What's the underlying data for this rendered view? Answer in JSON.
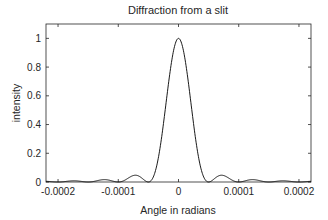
{
  "chart_data": {
    "type": "line",
    "title": "Diffraction from a slit",
    "xlabel": "Angle in radians",
    "ylabel": "intensity",
    "xlim": [
      -0.00022,
      0.00022
    ],
    "ylim": [
      0,
      1.1
    ],
    "xticks": [
      -0.0002,
      -0.0001,
      0,
      0.0001,
      0.0002
    ],
    "xtick_labels": [
      "-0.0002",
      "-0.0001",
      "0",
      "0.0001",
      "0.0002"
    ],
    "yticks": [
      0,
      0.2,
      0.4,
      0.6,
      0.8,
      1
    ],
    "ytick_labels": [
      "0",
      "0.2",
      "0.4",
      "0.6",
      "0.8",
      "1"
    ],
    "grid": false,
    "legend": null,
    "series": [
      {
        "name": "intensity",
        "function": "sinc^2(x / 5e-5)",
        "first_zero": 5e-05,
        "color": "#000000",
        "x": [
          -0.00022,
          -0.0002,
          -0.00018,
          -0.00017,
          -0.00015,
          -0.00012,
          -0.0001,
          -7.15e-05,
          -5e-05,
          -4e-05,
          -3e-05,
          -2e-05,
          -1e-05,
          0,
          1e-05,
          2e-05,
          3e-05,
          4e-05,
          5e-05,
          7.15e-05,
          0.0001,
          0.00012,
          0.00015,
          0.00017,
          0.00018,
          0.0002,
          0.00022
        ],
        "y": [
          0.005,
          0.0,
          0.007,
          0.008,
          0.0,
          0.016,
          0.0,
          0.047,
          0.0,
          0.055,
          0.255,
          0.573,
          0.875,
          1.0,
          0.875,
          0.573,
          0.255,
          0.055,
          0.0,
          0.047,
          0.0,
          0.016,
          0.0,
          0.008,
          0.007,
          0.0,
          0.005
        ]
      }
    ]
  },
  "plot_box": {
    "left": 46,
    "top": 24,
    "right": 311,
    "bottom": 182
  },
  "colors": {
    "axes": "#262626",
    "line": "#000000",
    "background": "#ffffff"
  }
}
